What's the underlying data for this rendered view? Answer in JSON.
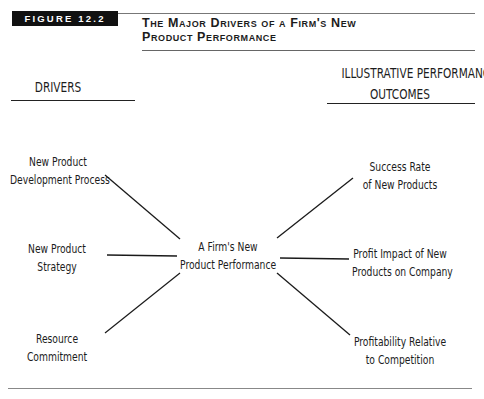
{
  "figure": {
    "badge": "FIGURE 12.2",
    "title_line1": "The Major Drivers of a Firm's New",
    "title_line2": "Product Performance"
  },
  "headers": {
    "left": "DRIVERS",
    "right_line1": "ILLUSTRATIVE PERFORMANCE",
    "right_line2": "OUTCOMES"
  },
  "center": {
    "line1": "A Firm's New",
    "line2": "Product Performance"
  },
  "drivers": [
    {
      "line1": "New Product",
      "line2": "Development Process"
    },
    {
      "line1": "New Product",
      "line2": "Strategy"
    },
    {
      "line1": "Resource",
      "line2": "Commitment"
    }
  ],
  "outcomes": [
    {
      "line1": "Success Rate",
      "line2": "of New Products"
    },
    {
      "line1": "Profit Impact of New",
      "line2": "Products on Company"
    },
    {
      "line1": "Profitability Relative",
      "line2": "to Competition"
    }
  ],
  "colors": {
    "badge_bg": "#111111",
    "badge_text": "#ffffff",
    "line": "#1a1a1a"
  }
}
